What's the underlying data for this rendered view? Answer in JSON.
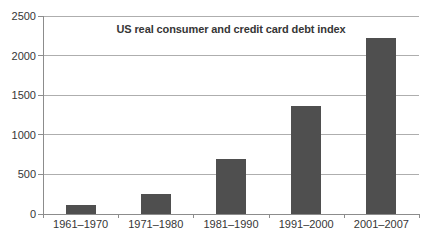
{
  "chart_data": {
    "type": "bar",
    "title": "US real consumer and credit card debt index",
    "categories": [
      "1961–1970",
      "1971–1980",
      "1981–1990",
      "1991–2000",
      "2001–2007"
    ],
    "values": [
      110,
      250,
      700,
      1360,
      2220
    ],
    "xlabel": "",
    "ylabel": "",
    "ylim": [
      0,
      2500
    ],
    "yticks": [
      0,
      500,
      1000,
      1500,
      2000,
      2500
    ],
    "grid": true,
    "legend_position": "none",
    "colors": {
      "bar": "#4f4f4f",
      "gridline": "#aeaeae",
      "axis": "#8c8c8c",
      "text": "#363636",
      "background": "#ffffff"
    }
  }
}
